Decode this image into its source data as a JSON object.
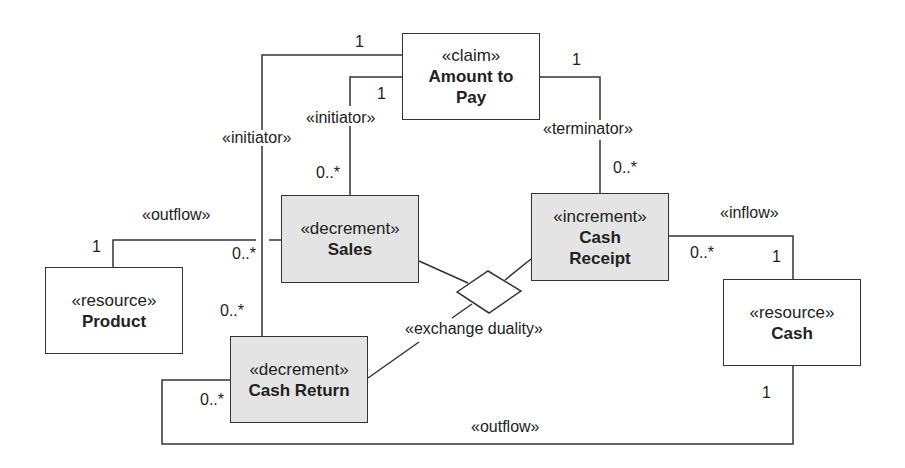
{
  "diagram": {
    "type": "REA UML class diagram",
    "colors": {
      "line": "#333333",
      "event_fill": "#e4e4e4",
      "resource_fill": "#ffffff"
    },
    "classes": [
      {
        "id": "amount_to_pay",
        "stereotype": "«claim»",
        "name": "Amount to Pay"
      },
      {
        "id": "sales",
        "stereotype": "«decrement»",
        "name": "Sales"
      },
      {
        "id": "cash_receipt",
        "stereotype": "«increment»",
        "name": "Cash Receipt"
      },
      {
        "id": "product",
        "stereotype": "«resource»",
        "name": "Product"
      },
      {
        "id": "cash_return",
        "stereotype": "«decrement»",
        "name": "Cash Return"
      },
      {
        "id": "cash",
        "stereotype": "«resource»",
        "name": "Cash"
      }
    ],
    "associations": [
      {
        "label": "«initiator»",
        "from": "amount_to_pay",
        "to": "cash_return",
        "from_mult": "1",
        "to_mult": "0..*"
      },
      {
        "label": "«initiator»",
        "from": "amount_to_pay",
        "to": "sales",
        "from_mult": "1",
        "to_mult": "0..*"
      },
      {
        "label": "«terminator»",
        "from": "amount_to_pay",
        "to": "cash_receipt",
        "from_mult": "1",
        "to_mult": "0..*"
      },
      {
        "label": "«outflow»",
        "from": "product",
        "to": "sales",
        "from_mult": "1",
        "to_mult": "0..*"
      },
      {
        "label": "«inflow»",
        "from": "cash",
        "to": "cash_receipt",
        "from_mult": "1",
        "to_mult": "0..*"
      },
      {
        "label": "«outflow»",
        "from": "cash",
        "to": "cash_return",
        "from_mult": "1",
        "to_mult": "0..*"
      },
      {
        "label": "«exchange duality»",
        "type": "n-ary diamond",
        "members": [
          "sales",
          "cash_receipt",
          "cash_return"
        ]
      }
    ],
    "labels": {
      "initiator_outer": "«initiator»",
      "initiator_inner": "«initiator»",
      "terminator": "«terminator»",
      "outflow_product": "«outflow»",
      "inflow": "«inflow»",
      "outflow_cash": "«outflow»",
      "exchange_duality": "«exchange duality»"
    },
    "multiplicities": {
      "claim_outer_1": "1",
      "claim_inner_1": "1",
      "claim_right_1": "1",
      "sales_top": "0..*",
      "receipt_top": "0..*",
      "product_1": "1",
      "sales_left": "0..*",
      "return_top": "0..*",
      "return_left": "0..*",
      "receipt_right": "0..*",
      "cash_top_1": "1",
      "cash_bottom_1": "1"
    }
  }
}
